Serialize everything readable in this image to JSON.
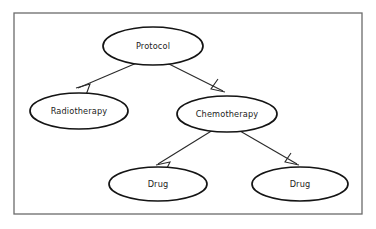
{
  "diagram": {
    "type": "tree-diagram",
    "background_color": "#ffffff",
    "frame": {
      "name": "diagram-border",
      "x": 14,
      "y": 13,
      "width": 348,
      "height": 201,
      "stroke_color": "#6b6b6b"
    },
    "node_style": {
      "shape": "ellipse",
      "fill_color": "#ffffff",
      "stroke_color": "#141414",
      "text_color": "#1c1c1c"
    },
    "edge_style": {
      "stroke_color": "#2a2a2a",
      "arrowhead": "open-v"
    },
    "nodes": [
      {
        "id": "protocol",
        "label": "Protocol",
        "cx": 153,
        "cy": 46,
        "rx": 50,
        "ry": 19,
        "level": 0
      },
      {
        "id": "radiotherapy",
        "label": "Radiotherapy",
        "cx": 79,
        "cy": 111,
        "rx": 49,
        "ry": 18,
        "level": 1
      },
      {
        "id": "chemotherapy",
        "label": "Chemotherapy",
        "cx": 227,
        "cy": 114,
        "rx": 50,
        "ry": 18,
        "level": 1
      },
      {
        "id": "drug-left",
        "label": "Drug",
        "cx": 158,
        "cy": 184,
        "rx": 49,
        "ry": 17,
        "level": 2
      },
      {
        "id": "drug-right",
        "label": "Drug",
        "cx": 300,
        "cy": 184,
        "rx": 48,
        "ry": 17,
        "level": 2
      }
    ],
    "edges": [
      {
        "id": "protocol-to-radiotherapy",
        "from": "protocol",
        "to": "radiotherapy",
        "x1": 139,
        "y1": 62,
        "x2": 78,
        "y2": 88,
        "head": "76,88 90,84 86,95"
      },
      {
        "id": "protocol-to-chemotherapy",
        "from": "protocol",
        "to": "chemotherapy",
        "x1": 163,
        "y1": 61,
        "x2": 223,
        "y2": 91,
        "head": "225,92 211,89 218,79"
      },
      {
        "id": "chemotherapy-to-drug-left",
        "from": "chemotherapy",
        "to": "drug-left",
        "x1": 213,
        "y1": 130,
        "x2": 158,
        "y2": 164,
        "head": "156,165 170,162 165,172"
      },
      {
        "id": "chemotherapy-to-drug-right",
        "from": "chemotherapy",
        "to": "drug-right",
        "x1": 240,
        "y1": 131,
        "x2": 297,
        "y2": 164,
        "head": "299,165 285,162 291,153"
      }
    ]
  }
}
